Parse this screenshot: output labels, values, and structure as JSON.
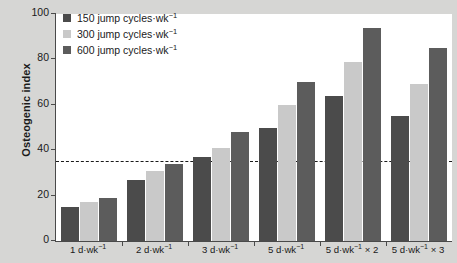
{
  "chart_data": {
    "type": "bar",
    "title": "",
    "subtitle": "",
    "xlabel": "",
    "ylabel": "Osteogenic index",
    "ylim": [
      0,
      100
    ],
    "yticks": [
      0,
      20,
      40,
      60,
      80,
      100
    ],
    "grid": false,
    "legend_position": "top-left",
    "categories": [
      "1 d·wk⁻¹",
      "2 d·wk⁻¹",
      "3 d·wk⁻¹",
      "5 d·wk⁻¹",
      "5 d·wk⁻¹ × 2",
      "5 d·wk⁻¹ × 3"
    ],
    "categories_parts": [
      {
        "base": "1 d·wk",
        "sup": "−1",
        "tail": ""
      },
      {
        "base": "2 d·wk",
        "sup": "−1",
        "tail": ""
      },
      {
        "base": "3 d·wk",
        "sup": "−1",
        "tail": ""
      },
      {
        "base": "5 d·wk",
        "sup": "−1",
        "tail": ""
      },
      {
        "base": "5 d·wk",
        "sup": "−1",
        "tail": " × 2"
      },
      {
        "base": "5 d·wk",
        "sup": "−1",
        "tail": " × 3"
      }
    ],
    "series": [
      {
        "name": "150 jump cycles·wk⁻¹",
        "name_base": "150 jump cycles·wk",
        "name_sup": "−1",
        "color": "#4b4b4b",
        "values": [
          15,
          27,
          37,
          50,
          64,
          55
        ]
      },
      {
        "name": "300 jump cycles·wk⁻¹",
        "name_base": "300 jump cycles·wk",
        "name_sup": "−1",
        "color": "#c9c9c9",
        "values": [
          17,
          31,
          41,
          60,
          79,
          69
        ]
      },
      {
        "name": "600 jump cycles·wk⁻¹",
        "name_base": "600 jump cycles·wk",
        "name_sup": "−1",
        "color": "#5c5c5c",
        "values": [
          19,
          34,
          48,
          70,
          94,
          85
        ]
      }
    ],
    "reference_line": {
      "value": 35,
      "style": "dashed",
      "color": "#1a1a1a"
    }
  },
  "colors": {
    "page_background": "#d6d6d4",
    "plot_background": "#ffffff",
    "axis": "#4a4a4a",
    "text": "#1a1a1a",
    "series_150": "#4b4b4b",
    "series_300": "#c9c9c9",
    "series_600": "#5c5c5c"
  }
}
